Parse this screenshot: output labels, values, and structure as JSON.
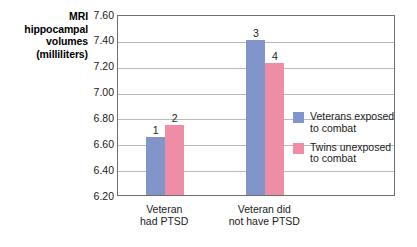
{
  "chart_data": {
    "type": "bar",
    "title": "",
    "xlabel": "",
    "ylabel": "MRI hippocampal volumes (milliliters)",
    "ylabel_lines": [
      "MRI",
      "hippocampal",
      "volumes",
      "(milliliters)"
    ],
    "categories": [
      "Veteran had PTSD",
      "Veteran did not have PTSD"
    ],
    "category_lines": [
      [
        "Veteran",
        "had PTSD"
      ],
      [
        "Veteran did",
        "not have PTSD"
      ]
    ],
    "ylim": [
      6.2,
      7.6
    ],
    "ytick_labels": [
      "7.60",
      "7.40",
      "7.20",
      "7.00",
      "6.80",
      "6.60",
      "6.40",
      "6.20"
    ],
    "ytick_values": [
      7.6,
      7.4,
      7.2,
      7.0,
      6.8,
      6.6,
      6.4,
      6.2
    ],
    "grid": true,
    "legend_position": "inside-right",
    "series": [
      {
        "name": "Veterans exposed to combat",
        "name_lines": [
          "Veterans exposed",
          "to combat"
        ],
        "color": "#8295cb",
        "values": [
          6.65,
          7.4
        ],
        "point_labels": [
          "1",
          "3"
        ]
      },
      {
        "name": "Twins unexposed to combat",
        "name_lines": [
          "Twins unexposed",
          "to combat"
        ],
        "color": "#ef8ca6",
        "values": [
          6.74,
          7.22
        ],
        "point_labels": [
          "2",
          "4"
        ]
      }
    ]
  }
}
